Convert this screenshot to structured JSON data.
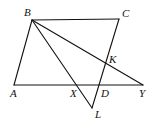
{
  "diagram": {
    "type": "geometry-figure",
    "colors": {
      "line": "#111111",
      "background": "#ffffff"
    },
    "points": {
      "A": {
        "label": "A",
        "x": 14,
        "y": 85,
        "lx": 10,
        "ly": 97
      },
      "B": {
        "label": "B",
        "x": 32,
        "y": 20,
        "lx": 24,
        "ly": 16
      },
      "C": {
        "label": "C",
        "x": 119,
        "y": 19,
        "lx": 122,
        "ly": 17
      },
      "D": {
        "label": "D",
        "x": 100,
        "y": 85,
        "lx": 101,
        "ly": 97
      },
      "X": {
        "label": "X",
        "x": 78,
        "y": 85,
        "lx": 70,
        "ly": 97
      },
      "Y": {
        "label": "Y",
        "x": 143,
        "y": 85,
        "lx": 139,
        "ly": 97
      },
      "K": {
        "label": "K",
        "x": 105,
        "y": 63,
        "lx": 109,
        "ly": 63
      },
      "L": {
        "label": "L",
        "x": 92,
        "y": 108,
        "lx": 95,
        "ly": 118
      }
    },
    "segments": [
      {
        "name": "AB",
        "from": "A",
        "to": "B"
      },
      {
        "name": "BC",
        "from": "B",
        "to": "C"
      },
      {
        "name": "CL",
        "from": "C",
        "to": "L"
      },
      {
        "name": "AY",
        "from": "A",
        "to": "Y"
      },
      {
        "name": "BY",
        "from": "B",
        "to": "Y"
      },
      {
        "name": "BL",
        "from": "B",
        "to": "L"
      }
    ]
  }
}
